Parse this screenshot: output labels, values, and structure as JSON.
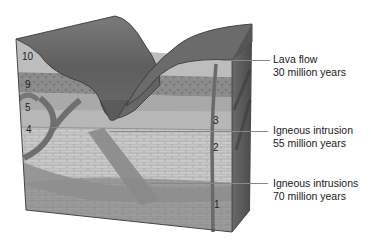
{
  "diagram": {
    "type": "geologic-block-diagram",
    "colors": {
      "lava": "#6e6e6e",
      "lava_dark": "#4f4f4f",
      "layer10": "#bdbdbd",
      "layer9": "#8a8a8a",
      "layer5": "#a8a8a8",
      "layer4": "#b5b5b5",
      "limestone": "#c8c8c8",
      "limestone_lines": "#9c9c9c",
      "layer1": "#9a9a9a",
      "intrusion": "#7c7c7c",
      "side_face": "#5a5a5a",
      "outline": "#3a3a3a"
    },
    "layer_labels": [
      {
        "id": "10",
        "text": "10"
      },
      {
        "id": "9",
        "text": "9"
      },
      {
        "id": "5",
        "text": "5"
      },
      {
        "id": "4",
        "text": "4"
      },
      {
        "id": "3",
        "text": "3"
      },
      {
        "id": "2",
        "text": "2"
      },
      {
        "id": "1",
        "text": "1"
      }
    ],
    "callouts": [
      {
        "title": "Lava flow",
        "age": "30 million years"
      },
      {
        "title": "Igneous intrusion",
        "age": "55 million years"
      },
      {
        "title": "Igneous intrusions",
        "age": "70 million years"
      }
    ]
  }
}
